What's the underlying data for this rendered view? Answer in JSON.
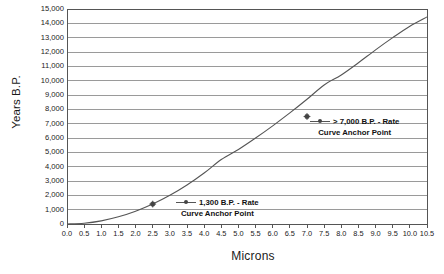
{
  "chart_data": {
    "type": "line",
    "title": "",
    "xlabel": "Microns",
    "ylabel": "Years B.P.",
    "xlim": [
      0.0,
      10.5
    ],
    "ylim": [
      0,
      15000
    ],
    "grid": "horizontal",
    "legend_position": "inline-annotations",
    "x_ticks": [
      "0.0",
      "0.5",
      "1.0",
      "1.5",
      "2.0",
      "2.5",
      "3.0",
      "3.5",
      "4.0",
      "4.5",
      "5.0",
      "5.5",
      "6.0",
      "6.5",
      "7.0",
      "7.5",
      "8.0",
      "8.5",
      "9.0",
      "9.5",
      "10.0",
      "10.5"
    ],
    "x_tick_values": [
      0.0,
      0.5,
      1.0,
      1.5,
      2.0,
      2.5,
      3.0,
      3.5,
      4.0,
      4.5,
      5.0,
      5.5,
      6.0,
      6.5,
      7.0,
      7.5,
      8.0,
      8.5,
      9.0,
      9.5,
      10.0,
      10.5
    ],
    "y_ticks": [
      "0",
      "1,000",
      "2,000",
      "3,000",
      "4,000",
      "5,000",
      "6,000",
      "7,000",
      "8,000",
      "9,000",
      "10,000",
      "11,000",
      "12,000",
      "13,000",
      "14,000",
      "15,000"
    ],
    "y_tick_values": [
      0,
      1000,
      2000,
      3000,
      4000,
      5000,
      6000,
      7000,
      8000,
      9000,
      10000,
      11000,
      12000,
      13000,
      14000,
      15000
    ],
    "series": [
      {
        "name": "Hydration Rate Curve",
        "x": [
          0.0,
          0.5,
          1.0,
          1.5,
          2.0,
          2.5,
          3.0,
          3.5,
          4.0,
          4.5,
          5.0,
          5.5,
          6.0,
          6.5,
          7.0,
          7.5,
          8.0,
          8.5,
          9.0,
          9.5,
          10.0,
          10.5
        ],
        "values": [
          0,
          55,
          220,
          500,
          890,
          1390,
          2000,
          2720,
          3555,
          4500,
          5555,
          6725,
          8000,
          9390,
          7500,
          12500,
          14220,
          16055,
          18000,
          20055,
          22220,
          24500
        ],
        "y": [
          0,
          55,
          220,
          500,
          890,
          1390,
          2000,
          2720,
          3555,
          4500,
          5200,
          6000,
          6850,
          7750,
          8700,
          9700,
          10400,
          11250,
          12150,
          13000,
          13800,
          14450
        ]
      }
    ],
    "markers": [
      {
        "x": 2.5,
        "y": 1390,
        "label": "1,300 B.P. anchor"
      },
      {
        "x": 7.0,
        "y": 7500,
        "label": "> 7,000 B.P. anchor"
      }
    ],
    "annotations": [
      {
        "id": "upper",
        "line1": "> 7,000 B.P. - Rate",
        "line2": "Curve Anchor Point"
      },
      {
        "id": "lower",
        "line1": "1,300 B.P. - Rate",
        "line2": "Curve Anchor Point"
      }
    ],
    "colors": {
      "curve": "#555555",
      "grid": "#9a9a9a",
      "axis": "#555555",
      "marker": "#444444",
      "text": "#1a1a1a",
      "background": "#ffffff"
    }
  }
}
